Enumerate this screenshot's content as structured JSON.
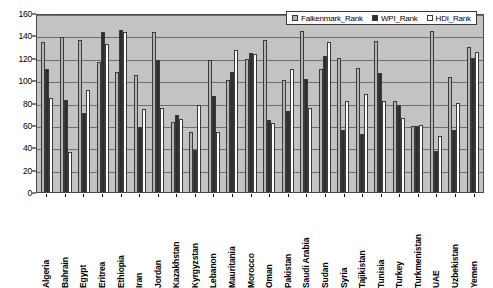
{
  "chart_data": {
    "type": "bar",
    "title": "",
    "xlabel": "",
    "ylabel": "",
    "ylim": [
      0,
      160
    ],
    "yticks": [
      0,
      20,
      40,
      60,
      80,
      100,
      120,
      140,
      160
    ],
    "grid": true,
    "legend_position": "top-right",
    "categories": [
      "Algeria",
      "Bahrain",
      "Egypt",
      "Eritrea",
      "Ethiopia",
      "Iran",
      "Jordan",
      "Kazakhstan",
      "Kyrgyzstan",
      "Lebanon",
      "Mauritania",
      "Morocco",
      "Oman",
      "Pakistan",
      "Saudi Arabia",
      "Sudan",
      "Syria",
      "Tajikistan",
      "Tunisia",
      "Turkey",
      "Turkmenistan",
      "UAE",
      "Uzbekistan",
      "Yemen"
    ],
    "series": [
      {
        "name": "Falkenmark_Rank",
        "color": "#b4b4b4",
        "values": [
          134,
          139,
          136,
          116,
          107,
          105,
          143,
          63,
          54,
          118,
          100,
          119,
          136,
          100,
          144,
          110,
          120,
          111,
          135,
          81,
          59,
          144,
          103,
          130
        ]
      },
      {
        "name": "WPI_Rank",
        "color": "#2e2e2e",
        "values": [
          110,
          82,
          71,
          143,
          145,
          58,
          118,
          69,
          38,
          86,
          107,
          124,
          64,
          72,
          101,
          122,
          55,
          52,
          106,
          78,
          59,
          37,
          55,
          120
        ]
      },
      {
        "name": "HDI_Rank",
        "color": "#ffffff",
        "values": [
          84,
          36,
          91,
          132,
          143,
          74,
          75,
          65,
          78,
          54,
          127,
          123,
          62,
          110,
          75,
          134,
          81,
          88,
          81,
          66,
          60,
          50,
          80,
          125
        ]
      }
    ]
  },
  "legend": {
    "items": [
      {
        "label": "Falkenmark_Rank",
        "color": "#b4b4b4"
      },
      {
        "label": "WPI_Rank",
        "color": "#2e2e2e"
      },
      {
        "label": "HDI_Rank",
        "color": "#ffffff"
      }
    ]
  },
  "colors": {
    "plot_background": "#c3c3c3",
    "gridline": "#6e6e6e",
    "axis": "#000000",
    "page_background": "#ffffff"
  }
}
